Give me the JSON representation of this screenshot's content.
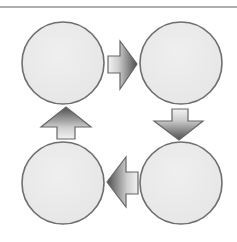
{
  "canvas": {
    "width": 237,
    "height": 242,
    "background": "#ffffff"
  },
  "colors": {
    "rule": "#5e5e5e",
    "node_fill": "#e6e6e6",
    "node_fill_light": "#efefef",
    "node_stroke": "#6e6e6e",
    "arrow_light": "#f2f2f2",
    "arrow_dark": "#4e4e4e",
    "arrow_stroke": "#666666"
  },
  "top_rule": {
    "x1": 0,
    "y1": 7,
    "x2": 237,
    "y2": 7,
    "width": 1.2
  },
  "diagram": {
    "type": "cycle",
    "direction": "clockwise",
    "nodes": [
      {
        "id": "top-left",
        "label": "",
        "cx": 63,
        "cy": 63,
        "r": 41
      },
      {
        "id": "top-right",
        "label": "",
        "cx": 181,
        "cy": 63,
        "r": 41
      },
      {
        "id": "bottom-right",
        "label": "",
        "cx": 181,
        "cy": 183,
        "r": 41
      },
      {
        "id": "bottom-left",
        "label": "",
        "cx": 63,
        "cy": 183,
        "r": 41
      }
    ],
    "arrows": [
      {
        "id": "right",
        "from": "top-left",
        "to": "top-right",
        "points": "108,56 120,56 120,41 137,64 120,89 120,73 108,73",
        "gradient": {
          "x1": "0",
          "y1": "0",
          "x2": "1",
          "y2": "0"
        }
      },
      {
        "id": "down",
        "from": "top-right",
        "to": "bottom-right",
        "points": "172,109 188,109 188,121 203,121 179,140 154,121 172,121",
        "gradient": {
          "x1": "0",
          "y1": "0",
          "x2": "0",
          "y2": "1"
        }
      },
      {
        "id": "left",
        "from": "bottom-right",
        "to": "bottom-left",
        "points": "138,172 138,194 126,194 126,207 107,182 126,157 126,172",
        "gradient": {
          "x1": "1",
          "y1": "0",
          "x2": "0",
          "y2": "0"
        }
      },
      {
        "id": "up",
        "from": "bottom-left",
        "to": "top-left",
        "points": "57,139 57,127 41,127 66,107 91,127 75,127 75,139",
        "gradient": {
          "x1": "0",
          "y1": "1",
          "x2": "0",
          "y2": "0"
        }
      }
    ]
  }
}
